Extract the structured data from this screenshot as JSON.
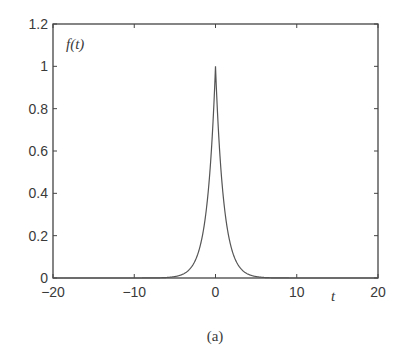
{
  "chart_data": {
    "type": "line",
    "title": "",
    "xlabel": "t",
    "ylabel": "f(t)",
    "xlim": [
      -20,
      20
    ],
    "ylim": [
      0,
      1.2
    ],
    "xticks": [
      -20,
      -10,
      0,
      10,
      20
    ],
    "xtick_labels": [
      "−20",
      "−10",
      "0",
      "10",
      "20"
    ],
    "yticks": [
      0,
      0.2,
      0.4,
      0.6,
      0.8,
      1,
      1.2
    ],
    "ytick_labels": [
      "0",
      "0.2",
      "0.4",
      "0.6",
      "0.8",
      "1",
      "1.2"
    ],
    "grid": false,
    "legend": null,
    "series": [
      {
        "name": "f(t)",
        "description": "sharp symmetric peak centered at t=0 with maximum 1, decaying to ~0 by |t|≈3",
        "x": [
          -20,
          -5,
          -4,
          -3,
          -2,
          -1.5,
          -1,
          -0.5,
          -0.25,
          0,
          0.25,
          0.5,
          1,
          1.5,
          2,
          3,
          4,
          5,
          20
        ],
        "y": [
          0,
          0.007,
          0.018,
          0.05,
          0.135,
          0.223,
          0.368,
          0.607,
          0.779,
          1,
          0.779,
          0.607,
          0.368,
          0.223,
          0.135,
          0.05,
          0.018,
          0.007,
          0
        ]
      }
    ],
    "caption": "(a)"
  },
  "labels": {
    "ylabel": "f(t)",
    "xlabel": "t",
    "caption": "(a)"
  }
}
